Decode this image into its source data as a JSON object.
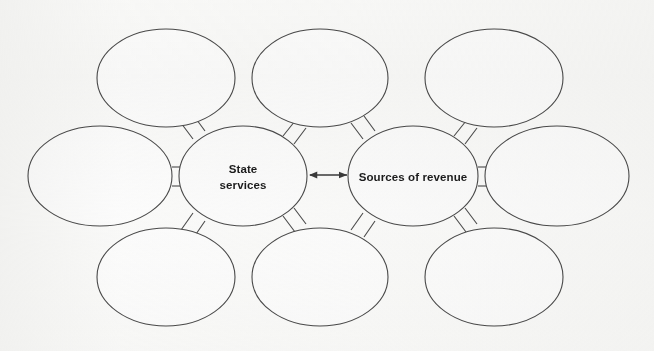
{
  "diagram": {
    "type": "concept-map",
    "background_color": "#fbfbfa",
    "stroke_color": "#4a4a4a",
    "text_color": "#1c1c1c",
    "center_nodes": [
      {
        "id": "state-services",
        "label_lines": [
          "State",
          "services"
        ],
        "line1": "State",
        "line2": "services",
        "cx": 243,
        "cy": 176,
        "rx": 64,
        "ry": 50
      },
      {
        "id": "sources-of-revenue",
        "label_lines": [
          "Sources of revenue"
        ],
        "line1": "Sources of revenue",
        "cx": 413,
        "cy": 176,
        "rx": 65,
        "ry": 50
      }
    ],
    "blank_nodes": [
      {
        "id": "blank-top-left",
        "label": "",
        "cx": 166,
        "cy": 78,
        "rx": 69,
        "ry": 49
      },
      {
        "id": "blank-top-center",
        "label": "",
        "cx": 320,
        "cy": 78,
        "rx": 68,
        "ry": 49
      },
      {
        "id": "blank-top-right",
        "label": "",
        "cx": 494,
        "cy": 78,
        "rx": 69,
        "ry": 49
      },
      {
        "id": "blank-middle-left",
        "label": "",
        "cx": 100,
        "cy": 176,
        "rx": 72,
        "ry": 50
      },
      {
        "id": "blank-middle-right",
        "label": "",
        "cx": 557,
        "cy": 176,
        "rx": 72,
        "ry": 50
      },
      {
        "id": "blank-bottom-left",
        "label": "",
        "cx": 166,
        "cy": 277,
        "rx": 69,
        "ry": 49
      },
      {
        "id": "blank-bottom-center",
        "label": "",
        "cx": 320,
        "cy": 277,
        "rx": 68,
        "ry": 49
      },
      {
        "id": "blank-bottom-right",
        "label": "",
        "cx": 494,
        "cy": 277,
        "rx": 69,
        "ry": 49
      }
    ],
    "connectors": [
      {
        "id": "connector-state-to-top-left",
        "from": "state-services",
        "to": "blank-top-left",
        "style": "double-line"
      },
      {
        "id": "connector-state-to-top-center",
        "from": "state-services",
        "to": "blank-top-center",
        "style": "double-line"
      },
      {
        "id": "connector-state-to-middle-left",
        "from": "state-services",
        "to": "blank-middle-left",
        "style": "double-line"
      },
      {
        "id": "connector-state-to-bottom-left",
        "from": "state-services",
        "to": "blank-bottom-left",
        "style": "double-line"
      },
      {
        "id": "connector-state-to-bottom-center",
        "from": "state-services",
        "to": "blank-bottom-center",
        "style": "double-line"
      },
      {
        "id": "connector-revenue-to-top-center",
        "from": "sources-of-revenue",
        "to": "blank-top-center",
        "style": "double-line"
      },
      {
        "id": "connector-revenue-to-top-right",
        "from": "sources-of-revenue",
        "to": "blank-top-right",
        "style": "double-line"
      },
      {
        "id": "connector-revenue-to-middle-right",
        "from": "sources-of-revenue",
        "to": "blank-middle-right",
        "style": "double-line"
      },
      {
        "id": "connector-revenue-to-bottom-center",
        "from": "sources-of-revenue",
        "to": "blank-bottom-center",
        "style": "double-line"
      },
      {
        "id": "connector-revenue-to-bottom-right",
        "from": "sources-of-revenue",
        "to": "blank-bottom-right",
        "style": "double-line"
      }
    ],
    "center_arrow": {
      "id": "double-headed-arrow",
      "from": "state-services",
      "to": "sources-of-revenue",
      "style": "double-headed",
      "x1": 309,
      "x2": 348,
      "y": 175
    }
  }
}
